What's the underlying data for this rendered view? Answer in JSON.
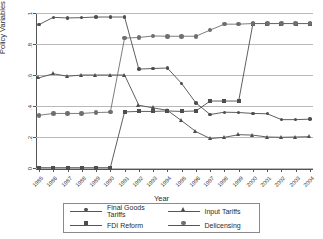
{
  "chart_data": {
    "type": "line",
    "title": "",
    "xlabel": "Year",
    "ylabel": "Policy Variables",
    "x": [
      1985,
      1986,
      1987,
      1988,
      1989,
      1990,
      1991,
      1992,
      1993,
      1994,
      1995,
      1996,
      1997,
      1998,
      1999,
      2000,
      2001,
      2002,
      2003,
      2004
    ],
    "xtick_labels": [
      "1985",
      "1986",
      "1987",
      "1988",
      "1989",
      "1990",
      "1991",
      "1992",
      "1993",
      "1994",
      "1995",
      "1996",
      "1997",
      "1998",
      "1999",
      "2000",
      "2001",
      "2002",
      "2003",
      "2004"
    ],
    "ytick_labels": [
      "0",
      ".2",
      ".4",
      ".6",
      ".8",
      "1"
    ],
    "ytick_values": [
      0,
      0.2,
      0.4,
      0.6,
      0.8,
      1
    ],
    "ylim": [
      0,
      1
    ],
    "xlim": [
      1985,
      2004
    ],
    "grid": true,
    "legend_position": "below-plot",
    "series": [
      {
        "name": "Final Goods Tariffs",
        "marker": "dot",
        "color": "#4d4d4d",
        "values": [
          0.925,
          0.972,
          0.968,
          0.97,
          0.974,
          0.974,
          0.974,
          0.638,
          0.642,
          0.645,
          0.545,
          0.42,
          0.345,
          0.36,
          0.358,
          0.352,
          0.35,
          0.312,
          0.312,
          0.315
        ]
      },
      {
        "name": "Input Tariffs",
        "marker": "triangle",
        "color": "#4d4d4d",
        "values": [
          0.582,
          0.608,
          0.592,
          0.6,
          0.6,
          0.6,
          0.6,
          0.405,
          0.388,
          0.372,
          0.305,
          0.235,
          0.19,
          0.198,
          0.215,
          0.212,
          0.2,
          0.198,
          0.2,
          0.202
        ]
      },
      {
        "name": "FDI Reform",
        "marker": "square",
        "color": "#4d4d4d",
        "values": [
          0.002,
          0.002,
          0.002,
          0.002,
          0.002,
          0.002,
          0.362,
          0.365,
          0.365,
          0.368,
          0.365,
          0.368,
          0.432,
          0.432,
          0.432,
          0.932,
          0.932,
          0.932,
          0.932,
          0.932
        ]
      },
      {
        "name": "Delicensing",
        "marker": "circle",
        "color": "#6e6e6e",
        "values": [
          0.34,
          0.352,
          0.352,
          0.352,
          0.358,
          0.36,
          0.838,
          0.842,
          0.852,
          0.85,
          0.85,
          0.85,
          0.89,
          0.928,
          0.928,
          0.932,
          0.932,
          0.932,
          0.932,
          0.932
        ]
      }
    ]
  },
  "legend": {
    "entries": [
      {
        "label": "Final Goods Tariffs",
        "marker": "dot"
      },
      {
        "label": "Input Tariffs",
        "marker": "triangle"
      },
      {
        "label": "FDI Reform",
        "marker": "square"
      },
      {
        "label": "Delicensing",
        "marker": "circle"
      }
    ]
  }
}
